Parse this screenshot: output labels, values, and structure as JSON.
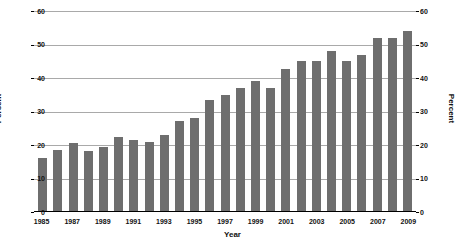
{
  "chart_data": {
    "type": "bar",
    "title": "",
    "xlabel": "Year",
    "ylabel": "Percent",
    "ylabel_right": "Percent",
    "ylim": [
      0,
      60
    ],
    "yticks": [
      0,
      10,
      20,
      30,
      40,
      50,
      60
    ],
    "grid": true,
    "legend": "none",
    "bar_color": "#6e6e6e",
    "categories": [
      "1985",
      "1986",
      "1987",
      "1988",
      "1989",
      "1990",
      "1991",
      "1992",
      "1993",
      "1994",
      "1995",
      "1996",
      "1997",
      "1998",
      "1999",
      "2000",
      "2001",
      "2002",
      "2003",
      "2004",
      "2005",
      "2006",
      "2007",
      "2008",
      "2009"
    ],
    "values": [
      16,
      18.5,
      20.5,
      18.3,
      19.5,
      22.5,
      21.5,
      20.8,
      23,
      27.3,
      28,
      33.3,
      35,
      37,
      39,
      37,
      42.7,
      45,
      45.2,
      48,
      45,
      47,
      52,
      52,
      54
    ],
    "xtick_labels": [
      "1985",
      "1987",
      "1989",
      "1991",
      "1993",
      "1995",
      "1997",
      "1999",
      "2001",
      "2003",
      "2005",
      "2007",
      "2009"
    ]
  }
}
